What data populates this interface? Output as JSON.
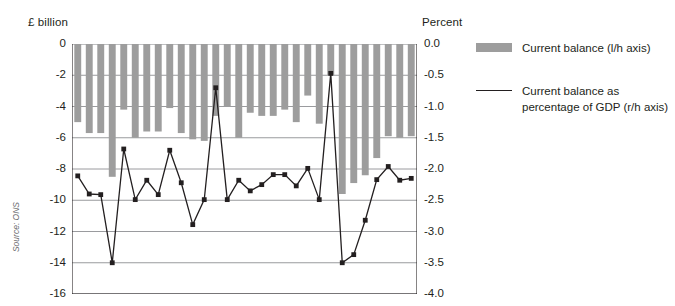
{
  "axes": {
    "left_caption": "£ billion",
    "right_caption": "Percent",
    "left_ticks": [
      "0",
      "-2",
      "-4",
      "-6",
      "-8",
      "-10",
      "-12",
      "-14",
      "-16"
    ],
    "right_ticks": [
      "0.0",
      "-0.5",
      "-1.0",
      "-1.5",
      "-2.0",
      "-2.5",
      "-3.0",
      "-3.5",
      "-4.0"
    ]
  },
  "source": {
    "label": "Source: ONS"
  },
  "legend": {
    "items": [
      {
        "marker": "bar",
        "color": "#9d9d9d",
        "line1": "Current balance (l/h axis)",
        "line2": ""
      },
      {
        "marker": "line",
        "color": "#231f20",
        "line1": "Current balance as",
        "line2": "percentage of GDP (r/h axis)"
      }
    ]
  },
  "chart_data": {
    "type": "bar",
    "title": "",
    "subtitle": "",
    "xlabel": "",
    "ylabel": "£ billion",
    "y2label": "Percent",
    "ylim": [
      -16,
      0
    ],
    "y2lim": [
      -4.0,
      0.0
    ],
    "yticks": [
      0,
      -2,
      -4,
      -6,
      -8,
      -10,
      -12,
      -14,
      -16
    ],
    "y2ticks": [
      0.0,
      -0.5,
      -1.0,
      -1.5,
      -2.0,
      -2.5,
      -3.0,
      -3.5,
      -4.0
    ],
    "grid": true,
    "legend_position": "right",
    "categories": [
      "1",
      "2",
      "3",
      "4",
      "5",
      "6",
      "7",
      "8",
      "9",
      "10",
      "11",
      "12",
      "13",
      "14",
      "15",
      "16",
      "17",
      "18",
      "19",
      "20",
      "21",
      "22",
      "23",
      "24",
      "25",
      "26",
      "27",
      "28",
      "29",
      "30"
    ],
    "series": [
      {
        "name": "Current balance (l/h axis)",
        "type": "bar",
        "axis": "left",
        "color": "#9d9d9d",
        "values": [
          -5.0,
          -5.7,
          -5.7,
          -8.5,
          -4.2,
          -6.0,
          -5.6,
          -5.6,
          -4.1,
          -5.7,
          -6.1,
          -6.2,
          -4.6,
          -4.0,
          -6.0,
          -4.4,
          -4.6,
          -4.6,
          -4.2,
          -5.0,
          -3.3,
          -5.1,
          -2.0,
          -9.6,
          -8.9,
          -8.4,
          -7.3,
          -5.9,
          -6.0,
          -5.9
        ]
      },
      {
        "name": "Current balance as percentage of GDP (r/h axis)",
        "type": "line",
        "axis": "right",
        "color": "#231f20",
        "values": [
          -2.11,
          -2.4,
          -2.41,
          -3.5,
          -1.68,
          -2.49,
          -2.18,
          -2.41,
          -1.7,
          -2.22,
          -2.89,
          -2.49,
          -0.7,
          -2.49,
          -2.18,
          -2.35,
          -2.25,
          -2.09,
          -2.09,
          -2.27,
          -1.99,
          -2.49,
          -0.47,
          -3.5,
          -3.37,
          -2.82,
          -2.17,
          -1.96,
          -2.18,
          -2.15
        ]
      }
    ]
  }
}
